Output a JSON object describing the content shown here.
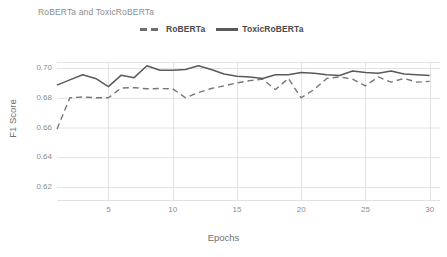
{
  "chart_data": {
    "type": "line",
    "title": "RoBERTa and ToxicRoBERTa",
    "xlabel": "Epochs",
    "ylabel": "F1 Score",
    "grid": true,
    "legend_position": "top-center",
    "xlim": [
      1,
      30
    ],
    "ylim": [
      0.61,
      0.706
    ],
    "xticks": [
      5,
      10,
      15,
      20,
      25,
      30
    ],
    "xtick_labels": [
      "5",
      "10",
      "15",
      "20",
      "25",
      "30"
    ],
    "yticks": [
      0.62,
      0.64,
      0.66,
      0.68,
      0.7
    ],
    "ytick_labels": [
      "0.62",
      "0.64",
      "0.66",
      "0.68",
      "0.70"
    ],
    "x": [
      1,
      2,
      3,
      4,
      5,
      6,
      7,
      8,
      9,
      10,
      11,
      12,
      13,
      14,
      15,
      16,
      17,
      18,
      19,
      20,
      21,
      22,
      23,
      24,
      25,
      26,
      27,
      28,
      29,
      30
    ],
    "series": [
      {
        "name": "RoBERTa",
        "style": "dashed",
        "color": "#767676",
        "values": [
          0.659,
          0.68,
          0.6805,
          0.68,
          0.68,
          0.6865,
          0.6868,
          0.686,
          0.6862,
          0.686,
          0.68,
          0.6835,
          0.6862,
          0.688,
          0.69,
          0.6915,
          0.6925,
          0.6855,
          0.693,
          0.68,
          0.6855,
          0.693,
          0.694,
          0.6925,
          0.688,
          0.694,
          0.6905,
          0.693,
          0.6905,
          0.691
        ]
      },
      {
        "name": "ToxicRoBERTa",
        "style": "solid",
        "color": "#5a5a5a",
        "values": [
          0.6885,
          0.692,
          0.6955,
          0.693,
          0.6875,
          0.6952,
          0.6935,
          0.7015,
          0.6985,
          0.6985,
          0.699,
          0.7015,
          0.699,
          0.696,
          0.6945,
          0.694,
          0.693,
          0.6955,
          0.6955,
          0.697,
          0.6965,
          0.6955,
          0.695,
          0.698,
          0.697,
          0.6965,
          0.698,
          0.696,
          0.6955,
          0.695
        ]
      }
    ]
  },
  "legend": {
    "items": [
      {
        "label": "RoBERTa"
      },
      {
        "label": "ToxicRoBERTa"
      }
    ]
  }
}
